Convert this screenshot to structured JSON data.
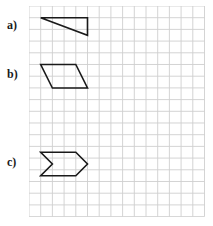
{
  "worksheet": {
    "background_color": "#ffffff",
    "grid": {
      "origin_x": 29,
      "origin_y": 6,
      "cell_size": 11.7,
      "columns": 15,
      "rows": 18,
      "line_color": "#cfcfcf",
      "line_width": 0.9
    },
    "stroke_color": "#1a1a1a",
    "stroke_width": 1.6,
    "items": [
      {
        "label": "a)",
        "label_x": 7,
        "label_y": 19,
        "shape_name": "right-triangle",
        "points": "11.7,11.7 58.5,11.7 58.5,29.3"
      },
      {
        "label": "b)",
        "label_x": 7,
        "label_y": 68,
        "shape_name": "parallelogram",
        "points": "11.7,58.5 46.8,58.5 58.5,82.0 23.4,82.0"
      },
      {
        "label": "c)",
        "label_x": 7,
        "label_y": 156,
        "shape_name": "chevron-pentagon",
        "points": "11.7,146.3 46.8,146.3 58.5,158.0 46.8,169.7 11.7,169.7 23.4,158.0"
      }
    ]
  }
}
